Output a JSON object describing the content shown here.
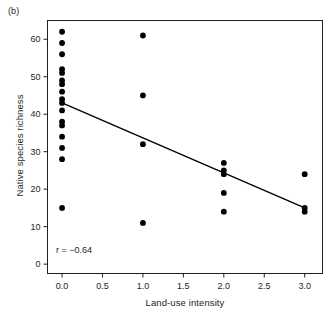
{
  "figure": {
    "panel_label": "(b)",
    "annotation": "r = −0.64"
  },
  "chart_data": {
    "type": "scatter",
    "title": "",
    "xlabel": "Land-use intensity",
    "ylabel": "Native species richness",
    "xlim": [
      -0.18,
      3.22
    ],
    "ylim": [
      -2.5,
      65
    ],
    "grid": false,
    "legend": null,
    "xticks": [
      0.0,
      0.5,
      1.0,
      1.5,
      2.0,
      2.5,
      3.0
    ],
    "xticklabels": [
      "0.0",
      "0.5",
      "1.0",
      "1.5",
      "2.0",
      "2.5",
      "3.0"
    ],
    "yticks": [
      0,
      10,
      20,
      30,
      40,
      50,
      60
    ],
    "yticklabels": [
      "0",
      "10",
      "20",
      "30",
      "40",
      "50",
      "60"
    ],
    "marker": "filled-circle",
    "marker_color": "#000000",
    "points": [
      {
        "x": 0.0,
        "y": 62
      },
      {
        "x": 0.0,
        "y": 59
      },
      {
        "x": 0.0,
        "y": 56
      },
      {
        "x": 0.0,
        "y": 52
      },
      {
        "x": 0.0,
        "y": 51
      },
      {
        "x": 0.0,
        "y": 49
      },
      {
        "x": 0.0,
        "y": 48
      },
      {
        "x": 0.0,
        "y": 46
      },
      {
        "x": 0.0,
        "y": 44
      },
      {
        "x": 0.0,
        "y": 43
      },
      {
        "x": 0.0,
        "y": 41
      },
      {
        "x": 0.0,
        "y": 38
      },
      {
        "x": 0.0,
        "y": 37
      },
      {
        "x": 0.0,
        "y": 34
      },
      {
        "x": 0.0,
        "y": 31
      },
      {
        "x": 0.0,
        "y": 28
      },
      {
        "x": 0.0,
        "y": 15
      },
      {
        "x": 1.0,
        "y": 61
      },
      {
        "x": 1.0,
        "y": 45
      },
      {
        "x": 1.0,
        "y": 32
      },
      {
        "x": 1.0,
        "y": 11
      },
      {
        "x": 2.0,
        "y": 27
      },
      {
        "x": 2.0,
        "y": 25
      },
      {
        "x": 2.0,
        "y": 24
      },
      {
        "x": 2.0,
        "y": 19
      },
      {
        "x": 2.0,
        "y": 14
      },
      {
        "x": 3.0,
        "y": 24
      },
      {
        "x": 3.0,
        "y": 15
      },
      {
        "x": 3.0,
        "y": 14
      }
    ],
    "fit_line": {
      "type": "linear-regression",
      "x_start": 0.0,
      "y_start": 43.0,
      "x_end": 3.0,
      "y_end": 15.0,
      "color": "#000000"
    },
    "correlation_r": -0.64
  }
}
